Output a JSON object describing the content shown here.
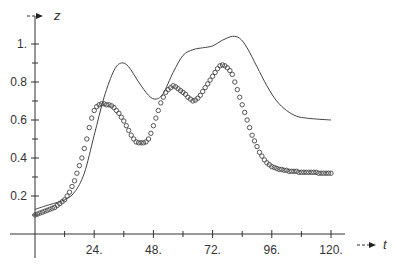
{
  "chart_data": {
    "type": "line",
    "title": "",
    "xlabel": "t",
    "ylabel": "z",
    "xlim": [
      0,
      120
    ],
    "ylim": [
      0,
      1.05
    ],
    "grid": false,
    "legend": null,
    "x_ticks": [
      {
        "value": 24,
        "label": "24."
      },
      {
        "value": 48,
        "label": "48."
      },
      {
        "value": 72,
        "label": "72."
      },
      {
        "value": 96,
        "label": "96."
      },
      {
        "value": 120,
        "label": "120."
      }
    ],
    "x_minor_ticks": [
      12,
      36,
      60,
      84,
      108
    ],
    "y_ticks": [
      {
        "value": 0.2,
        "label": "0.2"
      },
      {
        "value": 0.4,
        "label": "0.4"
      },
      {
        "value": 0.6,
        "label": "0.6"
      },
      {
        "value": 0.8,
        "label": "0.8"
      },
      {
        "value": 1.0,
        "label": "1."
      }
    ],
    "y_minor_ticks": [
      0.1,
      0.3,
      0.5,
      0.7,
      0.9
    ],
    "series": [
      {
        "name": "model",
        "style": "solid-line",
        "color": "#444444",
        "x": [
          0,
          6,
          12,
          16,
          20,
          24,
          28,
          32,
          35,
          38,
          42,
          46,
          49,
          52,
          56,
          60,
          64,
          68,
          72,
          76,
          80,
          83,
          86,
          90,
          94,
          98,
          102,
          106,
          110,
          114,
          120
        ],
        "y": [
          0.13,
          0.155,
          0.18,
          0.22,
          0.32,
          0.52,
          0.72,
          0.86,
          0.9,
          0.88,
          0.8,
          0.73,
          0.71,
          0.74,
          0.85,
          0.94,
          0.97,
          0.98,
          0.99,
          1.02,
          1.04,
          1.03,
          0.98,
          0.88,
          0.78,
          0.7,
          0.65,
          0.62,
          0.61,
          0.605,
          0.6
        ]
      },
      {
        "name": "data",
        "style": "open-circles",
        "color": "#444444",
        "x": [
          0,
          1,
          2,
          3,
          4,
          5,
          6,
          7,
          8,
          9,
          10,
          11,
          12,
          13,
          14,
          15,
          16,
          17,
          18,
          19,
          20,
          21,
          22,
          23,
          24,
          25,
          26,
          27,
          28,
          29,
          30,
          31,
          32,
          33,
          34,
          35,
          36,
          37,
          38,
          39,
          40,
          41,
          42,
          43,
          44,
          45,
          46,
          47,
          48,
          49,
          50,
          51,
          52,
          53,
          54,
          55,
          56,
          57,
          58,
          59,
          60,
          61,
          62,
          63,
          64,
          65,
          66,
          67,
          68,
          69,
          70,
          71,
          72,
          73,
          74,
          75,
          76,
          77,
          78,
          79,
          80,
          81,
          82,
          83,
          84,
          85,
          86,
          87,
          88,
          89,
          90,
          91,
          92,
          93,
          94,
          95,
          96,
          97,
          98,
          99,
          100,
          101,
          102,
          103,
          104,
          105,
          106,
          107,
          108,
          109,
          110,
          111,
          112,
          113,
          114,
          115,
          116,
          117,
          118,
          119,
          120
        ],
        "y": [
          0.1,
          0.105,
          0.11,
          0.115,
          0.12,
          0.125,
          0.13,
          0.135,
          0.14,
          0.15,
          0.16,
          0.17,
          0.18,
          0.2,
          0.22,
          0.25,
          0.28,
          0.32,
          0.36,
          0.4,
          0.45,
          0.5,
          0.56,
          0.61,
          0.65,
          0.67,
          0.68,
          0.685,
          0.685,
          0.68,
          0.68,
          0.675,
          0.665,
          0.65,
          0.635,
          0.615,
          0.595,
          0.57,
          0.545,
          0.52,
          0.5,
          0.485,
          0.48,
          0.48,
          0.48,
          0.485,
          0.5,
          0.53,
          0.57,
          0.61,
          0.65,
          0.69,
          0.72,
          0.745,
          0.76,
          0.77,
          0.78,
          0.775,
          0.765,
          0.755,
          0.745,
          0.735,
          0.72,
          0.71,
          0.7,
          0.705,
          0.715,
          0.73,
          0.75,
          0.77,
          0.79,
          0.81,
          0.83,
          0.85,
          0.87,
          0.885,
          0.89,
          0.885,
          0.875,
          0.86,
          0.84,
          0.8,
          0.76,
          0.72,
          0.68,
          0.64,
          0.6,
          0.56,
          0.52,
          0.49,
          0.46,
          0.43,
          0.41,
          0.39,
          0.375,
          0.365,
          0.355,
          0.35,
          0.345,
          0.34,
          0.34,
          0.335,
          0.335,
          0.33,
          0.33,
          0.33,
          0.33,
          0.325,
          0.325,
          0.325,
          0.325,
          0.325,
          0.325,
          0.325,
          0.325,
          0.32,
          0.32,
          0.32,
          0.32,
          0.32,
          0.32
        ]
      }
    ]
  },
  "axes": {
    "x_name": "t",
    "y_name": "z",
    "x_arrow": "- - ▶",
    "y_arrow": "- - ▶"
  }
}
